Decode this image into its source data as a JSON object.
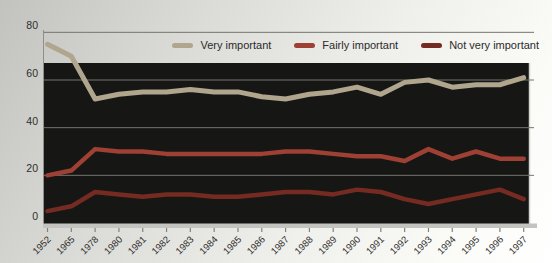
{
  "chart_data": {
    "type": "line",
    "title": "",
    "xlabel": "",
    "ylabel": "",
    "ylim": [
      0,
      80
    ],
    "yticks": [
      0,
      20,
      40,
      60,
      80
    ],
    "grid": true,
    "legend_position": "top-right",
    "plot_bg": "#161614",
    "grid_color": "#75756e",
    "axis_color": "#c3c3bf",
    "categories": [
      "1952",
      "1965",
      "1978",
      "1980",
      "1981",
      "1982",
      "1983",
      "1984",
      "1985",
      "1986",
      "1987",
      "1988",
      "1989",
      "1990",
      "1991",
      "1992",
      "1993",
      "1994",
      "1995",
      "1996",
      "1997"
    ],
    "series": [
      {
        "name": "Very important",
        "color": "#b0a68e",
        "width": 5,
        "values": [
          75,
          70,
          52,
          54,
          55,
          55,
          56,
          55,
          55,
          53,
          52,
          54,
          55,
          57,
          54,
          59,
          60,
          57,
          58,
          58,
          61
        ]
      },
      {
        "name": "Fairly important",
        "color": "#9e4034",
        "width": 4.5,
        "values": [
          20,
          22,
          31,
          30,
          30,
          29,
          29,
          29,
          29,
          29,
          30,
          30,
          29,
          28,
          28,
          26,
          31,
          27,
          30,
          27,
          27
        ]
      },
      {
        "name": "Not very important",
        "color": "#762b22",
        "width": 4.5,
        "values": [
          5,
          7,
          13,
          12,
          11,
          12,
          12,
          11,
          11,
          12,
          13,
          13,
          12,
          14,
          13,
          10,
          8,
          10,
          12,
          14,
          10
        ]
      }
    ]
  }
}
